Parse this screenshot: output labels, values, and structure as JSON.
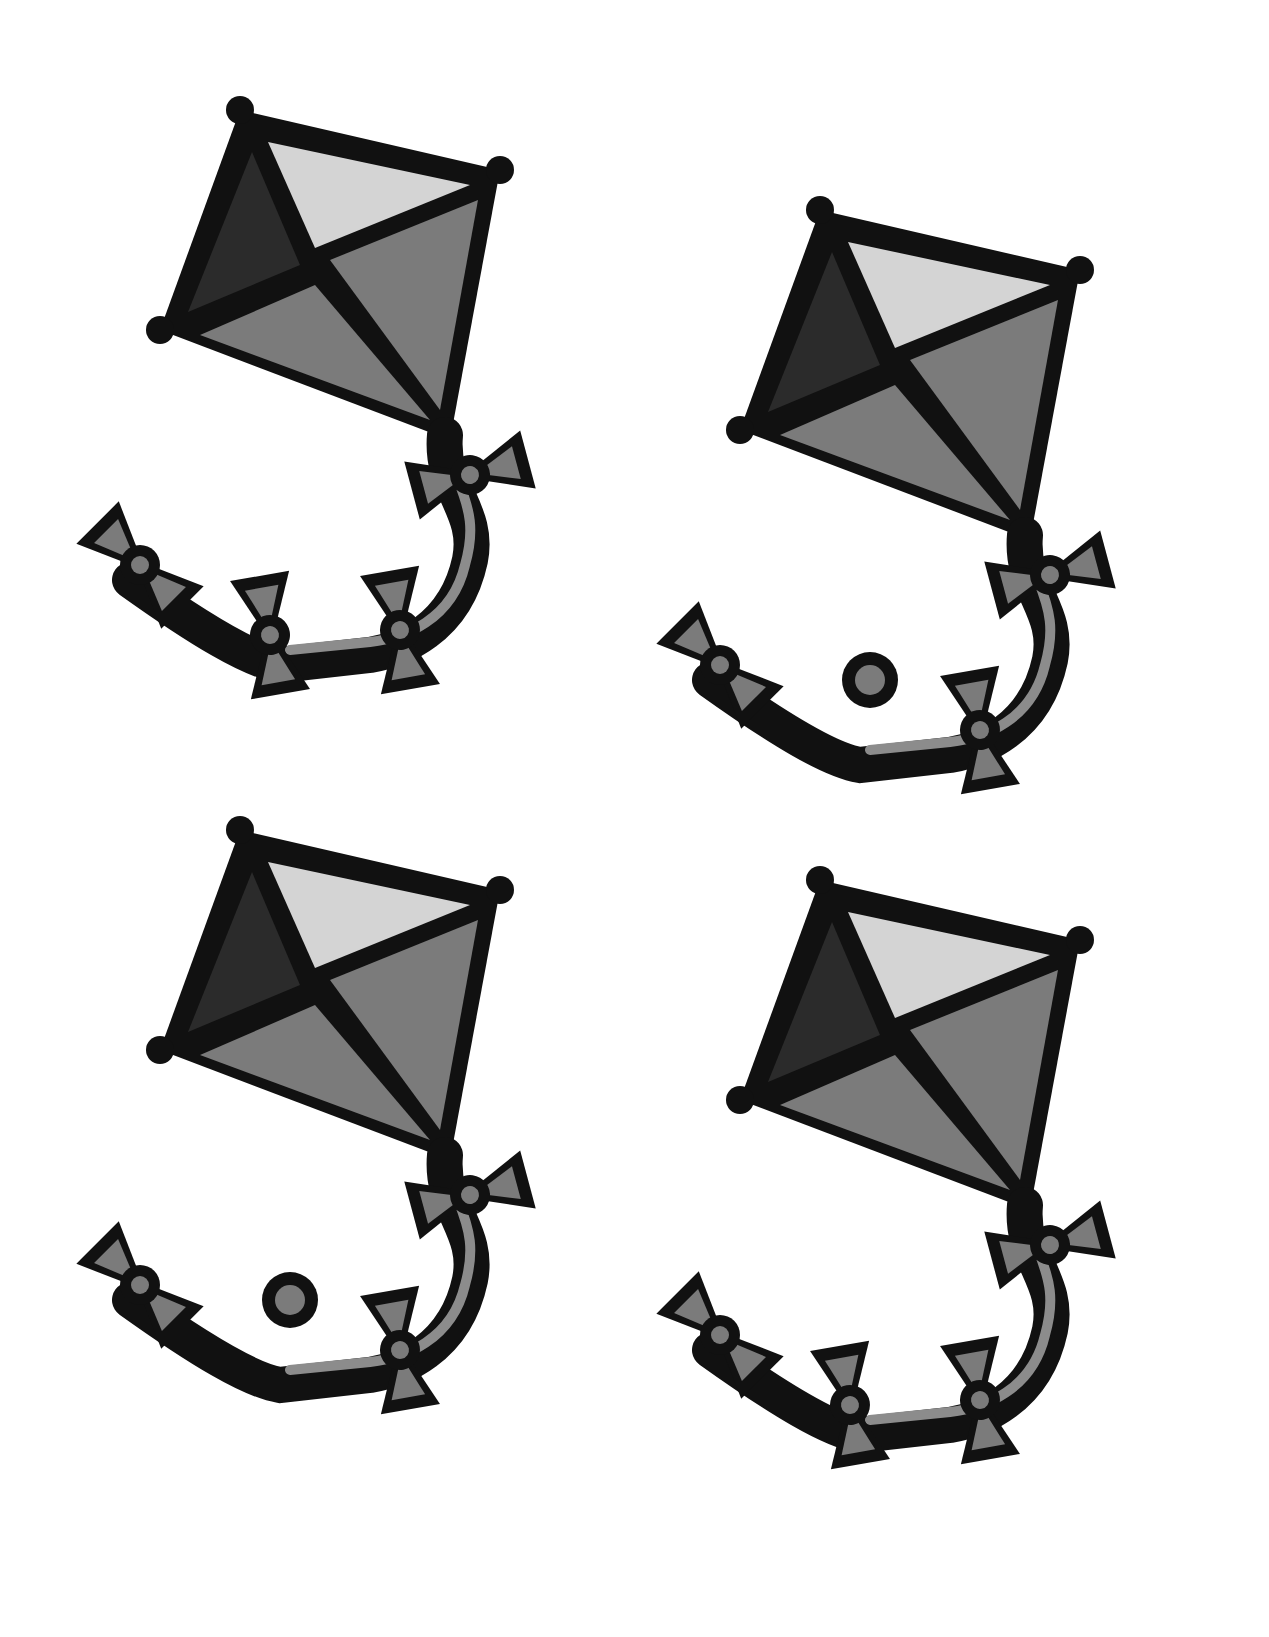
{
  "page": {
    "background": "#ffffff"
  },
  "colors": {
    "outline": "#111111",
    "light": "#d4d4d4",
    "dark": "#2b2b2b",
    "mid": "#7b7b7b",
    "tail": "#8c8c8c"
  },
  "kites": [
    {
      "id": "kite-top-left",
      "tail_style": "bows"
    },
    {
      "id": "kite-top-right",
      "tail_style": "bows-with-knob"
    },
    {
      "id": "kite-bottom-left",
      "tail_style": "bows-with-knob"
    },
    {
      "id": "kite-bottom-right",
      "tail_style": "bows"
    }
  ]
}
